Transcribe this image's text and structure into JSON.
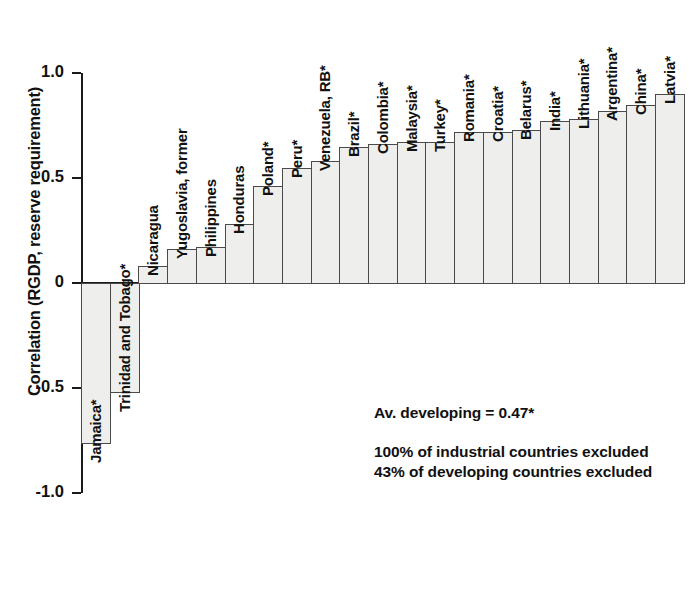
{
  "chart_data": {
    "type": "bar",
    "title": "",
    "xlabel": "",
    "ylabel": "Correlation (RGDP, reserve requirement)",
    "ylim": [
      -1.0,
      1.0
    ],
    "yticks": [
      "1.0",
      "0.5",
      "0",
      "-0.5",
      "-1.0"
    ],
    "ytick_values": [
      1.0,
      0.5,
      0,
      -0.5,
      -1.0
    ],
    "grid": false,
    "legend": null,
    "categories": [
      "Jamaica*",
      "Trinidad and Tobago*",
      "Nicaragua",
      "Yugoslavia, former",
      "Philippines",
      "Honduras",
      "Poland*",
      "Peru*",
      "Venezuela, RB*",
      "Brazil*",
      "Colombia*",
      "Malaysia*",
      "Turkey*",
      "Romania*",
      "Croatia*",
      "Belarus*",
      "India*",
      "Lithuania*",
      "Argentina*",
      "China*",
      "Latvia*"
    ],
    "values": [
      -0.76,
      -0.52,
      0.08,
      0.16,
      0.17,
      0.28,
      0.46,
      0.55,
      0.58,
      0.65,
      0.66,
      0.67,
      0.67,
      0.72,
      0.72,
      0.73,
      0.77,
      0.78,
      0.82,
      0.85,
      0.9
    ]
  },
  "annotations": {
    "average": "Av. developing = 0.47*",
    "industrial_excluded": "100% of industrial countries excluded",
    "developing_excluded": "43% of developing countries excluded"
  },
  "colors": {
    "bar_fill": "#eeeeec",
    "bar_stroke": "#4a4a4a",
    "axis": "#1a1a1a",
    "text": "#111111",
    "background": "#ffffff"
  }
}
